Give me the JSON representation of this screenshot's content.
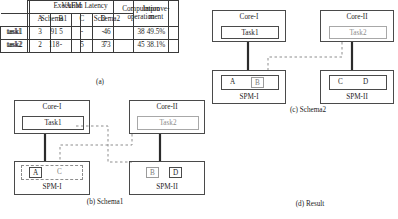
{
  "figure": {
    "panels": [
      {
        "id": "a",
        "caption": "(a)"
      },
      {
        "id": "b",
        "caption": "(b) Schema1"
      },
      {
        "id": "c",
        "caption": "(c) Schema2"
      },
      {
        "id": "d",
        "caption": "(d)  Result"
      }
    ]
  },
  "table_a": {
    "group_header": "VAFM",
    "computation_header_line1": "Computation",
    "computation_header_line2": "operation",
    "columns": [
      "A",
      "B",
      "C",
      "D"
    ],
    "rows": [
      {
        "label": "task1",
        "values": [
          "3",
          "5",
          "-",
          "-"
        ],
        "computation": "38"
      },
      {
        "label": "task2",
        "values": [
          "2",
          "-",
          "5",
          "3"
        ],
        "computation": "45"
      }
    ]
  },
  "schema1": {
    "core_left": {
      "title": "Core-I",
      "task": "Task1"
    },
    "core_right": {
      "title": "Core-II",
      "task": "Task2"
    },
    "spm_left": {
      "title": "SPM-I",
      "cells": [
        "A",
        "C"
      ]
    },
    "spm_right": {
      "title": "SPM-II",
      "cells": [
        "B",
        "D"
      ]
    }
  },
  "schema2": {
    "core_left": {
      "title": "Core-I",
      "task": "Task1"
    },
    "core_right": {
      "title": "Core-II",
      "task": "Task2"
    },
    "spm_left": {
      "title": "SPM-I",
      "cells": [
        "A",
        "B"
      ]
    },
    "spm_right": {
      "title": "SPM-II",
      "cells": [
        "C",
        "D"
      ]
    }
  },
  "table_d": {
    "group_header": "Execution Latency",
    "improvement_header_line1": "Improve-",
    "improvement_header_line2": "ment",
    "subcolumns": [
      "Schema1",
      "Schema2"
    ],
    "rows": [
      {
        "label": "task1",
        "schema1": "91",
        "schema2": "46",
        "improvement": "49.5%"
      },
      {
        "label": "task2",
        "schema1": "118",
        "schema2": "73",
        "improvement": "38.1%"
      }
    ]
  },
  "colors": {
    "line": "#4a4a4a",
    "ghost": "#9b9b9b",
    "solid_link": "#2b2b2b"
  }
}
